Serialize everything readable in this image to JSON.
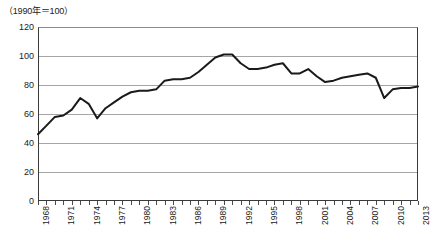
{
  "chart_data": {
    "type": "line",
    "title": "",
    "unit_note": "（1990年＝100）",
    "xlabel": "",
    "ylabel": "",
    "xlim": [
      1968,
      2013
    ],
    "ylim": [
      0,
      120
    ],
    "ytick_values": [
      0,
      20,
      40,
      60,
      80,
      100,
      120
    ],
    "ytick_labels": [
      "0",
      "20",
      "40",
      "60",
      "80",
      "100",
      "120"
    ],
    "xtick_labels": [
      "1968",
      "1971",
      "1974",
      "1977",
      "1980",
      "1983",
      "1986",
      "1989",
      "1992",
      "1995",
      "1998",
      "2001",
      "2004",
      "2007",
      "2010",
      "2013"
    ],
    "xtick_label_years": [
      1968,
      1971,
      1974,
      1977,
      1980,
      1983,
      1986,
      1989,
      1992,
      1995,
      1998,
      2001,
      2004,
      2007,
      2010,
      2013
    ],
    "grid": "horizontal",
    "legend": "none",
    "line_color": "#1a1a1a",
    "grid_color": "#a6a6a6",
    "x": [
      1968,
      1969,
      1970,
      1971,
      1972,
      1973,
      1974,
      1975,
      1976,
      1977,
      1978,
      1979,
      1980,
      1981,
      1982,
      1983,
      1984,
      1985,
      1986,
      1987,
      1988,
      1989,
      1990,
      1991,
      1992,
      1993,
      1994,
      1995,
      1996,
      1997,
      1998,
      1999,
      2000,
      2001,
      2002,
      2003,
      2004,
      2005,
      2006,
      2007,
      2008,
      2009,
      2010,
      2011,
      2012,
      2013
    ],
    "values": [
      46,
      52,
      58,
      59,
      63,
      71,
      67,
      57,
      64,
      68,
      72,
      75,
      76,
      76,
      77,
      83,
      84,
      84,
      85,
      89,
      94,
      99,
      101,
      101,
      95,
      91,
      91,
      92,
      94,
      95,
      88,
      88,
      91,
      86,
      82,
      83,
      85,
      86,
      87,
      88,
      85,
      71,
      77,
      78,
      78,
      79
    ],
    "series": [
      {
        "name": "index",
        "values": [
          46,
          52,
          58,
          59,
          63,
          71,
          67,
          57,
          64,
          68,
          72,
          75,
          76,
          76,
          77,
          83,
          84,
          84,
          85,
          89,
          94,
          99,
          101,
          101,
          95,
          91,
          91,
          92,
          94,
          95,
          88,
          88,
          91,
          86,
          82,
          83,
          85,
          86,
          87,
          88,
          85,
          71,
          77,
          78,
          78,
          79
        ]
      }
    ]
  }
}
